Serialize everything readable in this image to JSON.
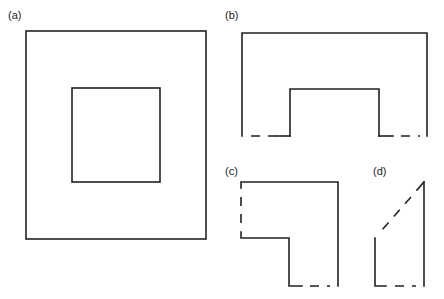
{
  "diagram": {
    "panels": [
      {
        "id": "a",
        "label": "(a)",
        "description": "Square frame: outer square with concentric inner square"
      },
      {
        "id": "b",
        "label": "(b)",
        "description": "Upper half of frame, bottom edges dashed (cut)"
      },
      {
        "id": "c",
        "label": "(c)",
        "description": "Corner quarter of frame, cut edges dashed"
      },
      {
        "id": "d",
        "label": "(d)",
        "description": "Triangular segment with dashed diagonal cut"
      }
    ]
  }
}
